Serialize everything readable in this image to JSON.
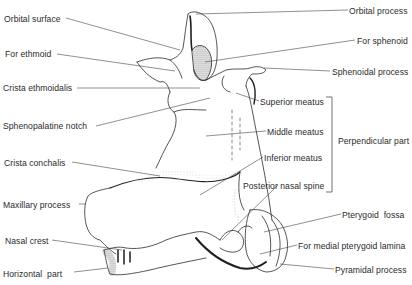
{
  "diagram": {
    "colors": {
      "ink": "#2b2b2b",
      "background": "#ffffff",
      "stipple": "#6a6a6a"
    },
    "labels_left": [
      {
        "id": "orbital-surface",
        "text": "Orbital surface",
        "x": 4,
        "y": 14
      },
      {
        "id": "for-ethmoid",
        "text": "For ethmoid",
        "x": 5,
        "y": 49
      },
      {
        "id": "crista-ethmoidalis",
        "text": "Crista ethmoidalis",
        "x": 3,
        "y": 83
      },
      {
        "id": "sphenopalatine-notch",
        "text": "Sphenopalatine notch",
        "x": 3,
        "y": 121
      },
      {
        "id": "crista-conchalis",
        "text": "Crista conchalis",
        "x": 4,
        "y": 158
      },
      {
        "id": "maxillary-process",
        "text": "Maxillary process",
        "x": 3,
        "y": 200
      },
      {
        "id": "nasal-crest",
        "text": "Nasal crest",
        "x": 5,
        "y": 236
      },
      {
        "id": "horizontal-part",
        "text": "Horizontal  part",
        "x": 3,
        "y": 269
      }
    ],
    "labels_right": [
      {
        "id": "orbital-process",
        "text": "Orbital process",
        "x": 349,
        "y": 6
      },
      {
        "id": "for-sphenoid",
        "text": "For sphenoid",
        "x": 357,
        "y": 36
      },
      {
        "id": "sphenoidal-process",
        "text": "Sphenoidal process",
        "x": 332,
        "y": 67
      },
      {
        "id": "superior-meatus",
        "text": "Superior meatus",
        "x": 260,
        "y": 97
      },
      {
        "id": "middle-meatus",
        "text": "Middle meatus",
        "x": 267,
        "y": 127
      },
      {
        "id": "perpendicular-part",
        "text": "Perpendicular part",
        "x": 338,
        "y": 136
      },
      {
        "id": "inferior-meatus",
        "text": "Inferior meatus",
        "x": 264,
        "y": 153
      },
      {
        "id": "posterior-nasal-spine",
        "text": "Posterior nasal spine",
        "x": 243,
        "y": 181
      },
      {
        "id": "pterygoid-fossa",
        "text": "Pterygoid  fossa",
        "x": 342,
        "y": 210
      },
      {
        "id": "for-medial-pterygoid-lamina",
        "text": "For medial pterygoid lamina",
        "x": 298,
        "y": 241
      },
      {
        "id": "pyramidal-process",
        "text": "Pyramidal process",
        "x": 335,
        "y": 265
      }
    ],
    "bracket": {
      "group_label": "Perpendicular part",
      "members": [
        "Superior meatus",
        "Middle meatus",
        "Inferior meatus",
        "Posterior nasal spine"
      ]
    }
  }
}
